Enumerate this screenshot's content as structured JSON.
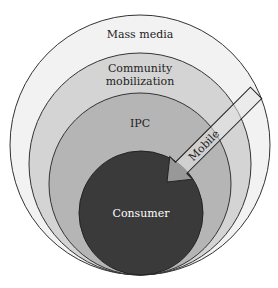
{
  "diagram": {
    "title": "",
    "layers": [
      {
        "id": "mass-media",
        "label": "Mass media",
        "fill": "#f2f2f2"
      },
      {
        "id": "community-mobilization",
        "label_lines": [
          "Community",
          "mobilization"
        ],
        "fill": "#d4d4d4"
      },
      {
        "id": "ipc",
        "label": "IPC",
        "fill": "#b5b5b5"
      },
      {
        "id": "consumer",
        "label": "Consumer",
        "fill": "#3a3a3a",
        "text_color": "#ffffff"
      }
    ],
    "arrow": {
      "label": "Mobile",
      "fill": "#e6e6e6",
      "direction": "inward toward consumer"
    },
    "stroke_color": "#333333"
  }
}
